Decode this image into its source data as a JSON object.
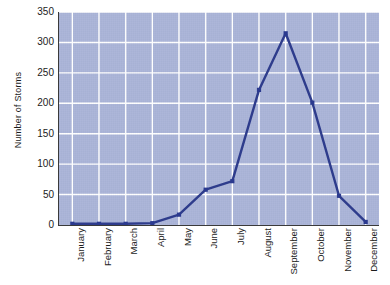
{
  "chart_data": {
    "type": "line",
    "title": "",
    "xlabel": "",
    "ylabel": "Number of Storms",
    "categories": [
      "January",
      "February",
      "March",
      "April",
      "May",
      "June",
      "July",
      "August",
      "September",
      "October",
      "November",
      "December"
    ],
    "values": [
      2,
      2,
      2,
      3,
      17,
      58,
      72,
      222,
      315,
      201,
      48,
      5
    ],
    "series": [
      {
        "name": "Number of Storms",
        "values": [
          2,
          2,
          2,
          3,
          17,
          58,
          72,
          222,
          315,
          201,
          48,
          5
        ]
      }
    ],
    "ylim": [
      0,
      350
    ],
    "ytick_step": 50,
    "yticks": [
      "0",
      "50",
      "100",
      "150",
      "200",
      "250",
      "300",
      "350"
    ],
    "xlim_categories": 12,
    "grid": true,
    "grid_color": "#ffffff",
    "legend": false,
    "legend_position": "none",
    "plot_background": "#aab4d8",
    "line_color": "#2e3c8c",
    "marker_color": "#2b3a8f",
    "marker_shape": "square",
    "axis_color": "#3a3a3a",
    "figure_background": "#ffffff"
  },
  "axis": {
    "y_title": "Number of Storms"
  }
}
